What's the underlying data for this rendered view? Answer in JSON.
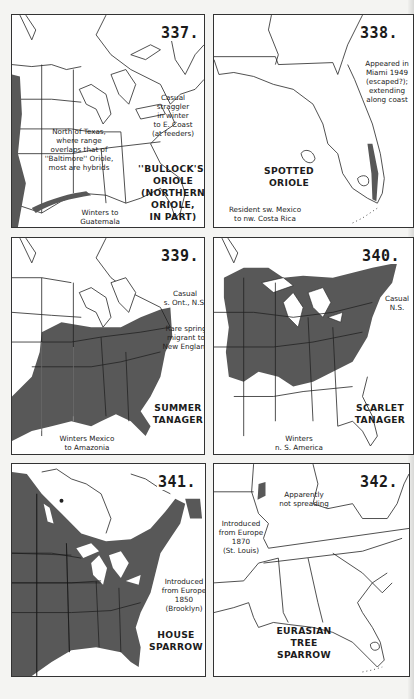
{
  "page": {
    "shade_color": "#585858",
    "line_color": "#222222",
    "background": "#f4f4f2"
  },
  "maps": [
    {
      "number": "337.",
      "title_lines": [
        "''BULLOCK'S''",
        "ORIOLE",
        "(NORTHERN",
        "ORIOLE,",
        "IN PART)"
      ],
      "notes": [
        {
          "lines": [
            "Casual",
            "straggler",
            "in winter",
            "to E. Coast",
            "(at feeders)"
          ]
        },
        {
          "lines": [
            "North of Texas,",
            "where range",
            "overlaps that of",
            "''Baltimore'' Oriole,",
            "most are hybrids"
          ]
        },
        {
          "lines": [
            "Winters to",
            "Guatemala"
          ]
        }
      ]
    },
    {
      "number": "338.",
      "title_lines": [
        "SPOTTED",
        "ORIOLE"
      ],
      "notes": [
        {
          "lines": [
            "Appeared in",
            "Miami 1949",
            "(escaped?);",
            "extending",
            "along coast"
          ]
        },
        {
          "lines": [
            "Resident sw. Mexico",
            "to nw. Costa Rica"
          ]
        }
      ]
    },
    {
      "number": "339.",
      "title_lines": [
        "SUMMER",
        "TANAGER"
      ],
      "notes": [
        {
          "lines": [
            "Casual",
            "s. Ont., N.S."
          ]
        },
        {
          "lines": [
            "Rare spring",
            "migrant to",
            "New England"
          ]
        },
        {
          "lines": [
            "Winters Mexico",
            "to Amazonia"
          ]
        }
      ]
    },
    {
      "number": "340.",
      "title_lines": [
        "SCARLET",
        "TANAGER"
      ],
      "notes": [
        {
          "lines": [
            "Casual",
            "N.S."
          ]
        },
        {
          "lines": [
            "Winters",
            "n. S. America"
          ]
        }
      ]
    },
    {
      "number": "341.",
      "title_lines": [
        "HOUSE",
        "SPARROW"
      ],
      "notes": [
        {
          "lines": [
            "Introduced",
            "from Europe",
            "1850",
            "(Brooklyn)"
          ]
        }
      ]
    },
    {
      "number": "342.",
      "title_lines": [
        "EURASIAN",
        "TREE",
        "SPARROW"
      ],
      "notes": [
        {
          "lines": [
            "Apparently",
            "not spreading"
          ]
        },
        {
          "lines": [
            "Introduced",
            "from Europe",
            "1870",
            "(St. Louis)"
          ]
        }
      ]
    }
  ]
}
